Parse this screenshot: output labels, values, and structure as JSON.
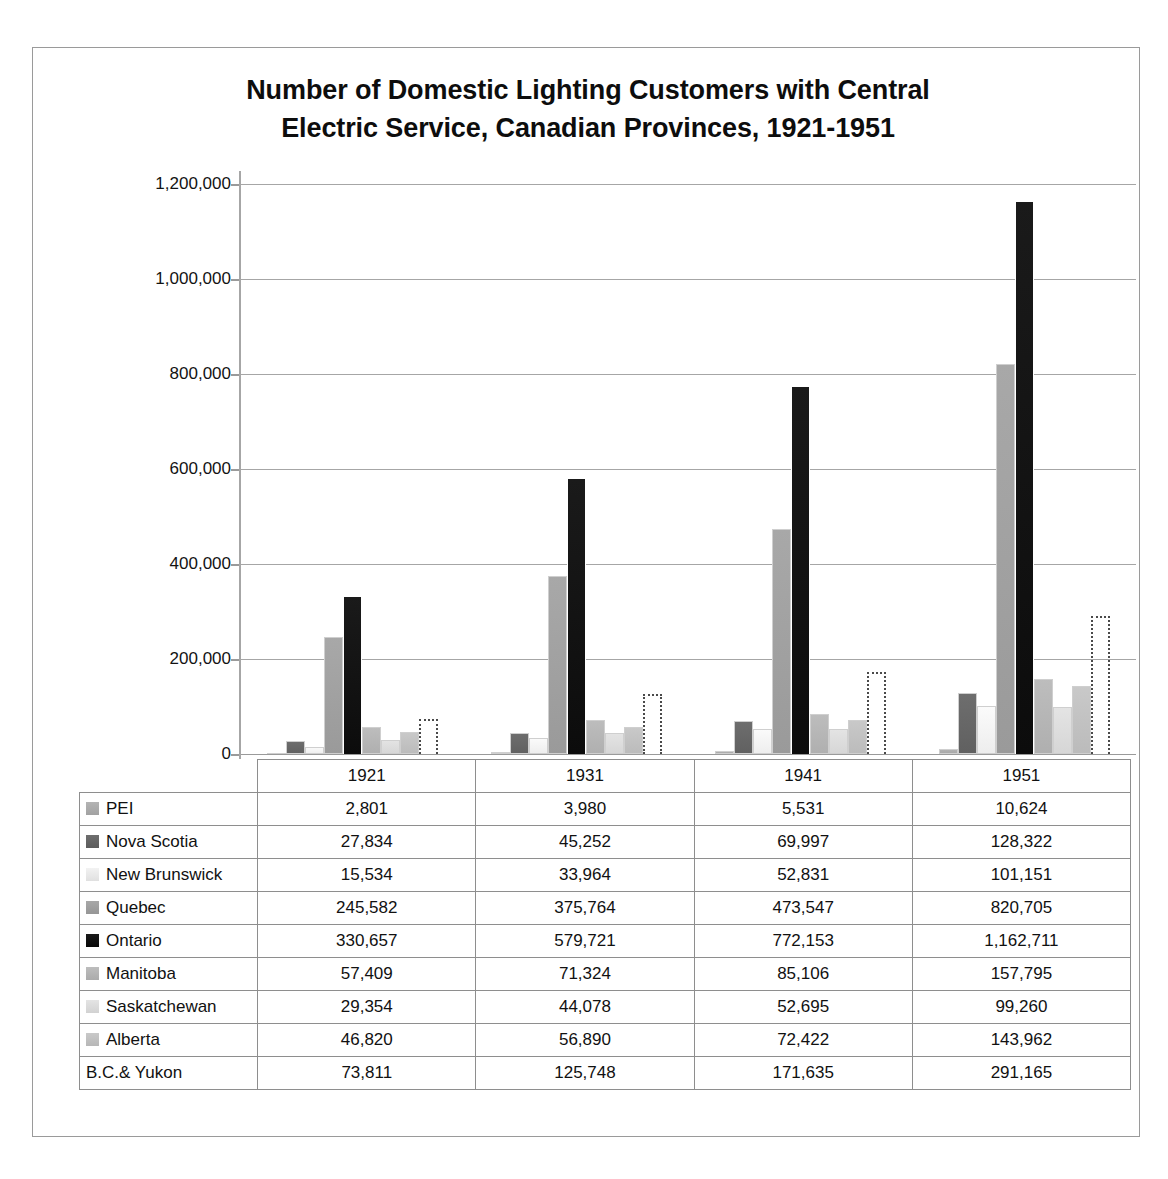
{
  "chart_data": {
    "type": "bar",
    "title": "Number of Domestic Lighting Customers with Central Electric Service, Canadian Provinces, 1921-1951",
    "title_line1": "Number of Domestic Lighting Customers with Central",
    "title_line2": "Electric Service, Canadian Provinces, 1921-1951",
    "xlabel": "",
    "ylabel": "",
    "ylim": [
      0,
      1200000
    ],
    "grid": true,
    "legend_position": "table-row-labels",
    "categories": [
      "1921",
      "1931",
      "1941",
      "1951"
    ],
    "ytick_labels": [
      "1,200,000",
      "1,000,000",
      "800,000",
      "600,000",
      "400,000",
      "200,000",
      "0"
    ],
    "ytick_values": [
      1200000,
      1000000,
      800000,
      600000,
      400000,
      200000,
      0
    ],
    "series": [
      {
        "name": "PEI",
        "color": "#b4b4b4",
        "values": [
          2801,
          3980,
          5531,
          10624
        ],
        "display": [
          "2,801",
          "3,980",
          "5,531",
          "10,624"
        ]
      },
      {
        "name": "Nova Scotia",
        "color": "#6e6e6e",
        "values": [
          27834,
          45252,
          69997,
          128322
        ],
        "display": [
          "27,834",
          "45,252",
          "69,997",
          "128,322"
        ]
      },
      {
        "name": "New Brunswick",
        "color": "#fbfbfb",
        "values": [
          15534,
          33964,
          52831,
          101151
        ],
        "display": [
          "15,534",
          "33,964",
          "52,831",
          "101,151"
        ]
      },
      {
        "name": "Quebec",
        "color": "#a8a8a8",
        "values": [
          245582,
          375764,
          473547,
          820705
        ],
        "display": [
          "245,582",
          "375,764",
          "473,547",
          "820,705"
        ]
      },
      {
        "name": "Ontario",
        "color": "#1a1a1a",
        "values": [
          330657,
          579721,
          772153,
          1162711
        ],
        "display": [
          "330,657",
          "579,721",
          "772,153",
          "1,162,711"
        ]
      },
      {
        "name": "Manitoba",
        "color": "#bdbdbd",
        "values": [
          57409,
          71324,
          85106,
          157795
        ],
        "display": [
          "57,409",
          "71,324",
          "85,106",
          "157,795"
        ]
      },
      {
        "name": "Saskatchewan",
        "color": "#e4e4e4",
        "values": [
          29354,
          44078,
          52695,
          99260
        ],
        "display": [
          "29,354",
          "44,078",
          "52,695",
          "99,260"
        ]
      },
      {
        "name": "Alberta",
        "color": "#c9c9c9",
        "values": [
          46820,
          56890,
          72422,
          143962
        ],
        "display": [
          "46,820",
          "56,890",
          "72,422",
          "143,962"
        ]
      },
      {
        "name": "B.C.& Yukon",
        "color": "#ffffff",
        "values": [
          73811,
          125748,
          171635,
          291165
        ],
        "display": [
          "73,811",
          "125,748",
          "171,635",
          "291,165"
        ]
      }
    ]
  },
  "table": {
    "corner_label": "",
    "column_headers": [
      "1921",
      "1931",
      "1941",
      "1951"
    ],
    "rows": [
      {
        "label": "PEI",
        "swatch": "#b4b4b4",
        "values": [
          "2,801",
          "3,980",
          "5,531",
          "10,624"
        ]
      },
      {
        "label": "Nova Scotia",
        "swatch": "#6e6e6e",
        "values": [
          "27,834",
          "45,252",
          "69,997",
          "128,322"
        ]
      },
      {
        "label": "New Brunswick",
        "swatch": "#f2f2f2",
        "values": [
          "15,534",
          "33,964",
          "52,831",
          "101,151"
        ]
      },
      {
        "label": "Quebec",
        "swatch": "#a8a8a8",
        "values": [
          "245,582",
          "375,764",
          "473,547",
          "820,705"
        ]
      },
      {
        "label": "Ontario",
        "swatch": "#1a1a1a",
        "values": [
          "330,657",
          "579,721",
          "772,153",
          "1,162,711"
        ]
      },
      {
        "label": "Manitoba",
        "swatch": "#bdbdbd",
        "values": [
          "57,409",
          "71,324",
          "85,106",
          "157,795"
        ]
      },
      {
        "label": "Saskatchewan",
        "swatch": "#e4e4e4",
        "values": [
          "29,354",
          "44,078",
          "52,695",
          "99,260"
        ]
      },
      {
        "label": "Alberta",
        "swatch": "#c9c9c9",
        "values": [
          "46,820",
          "56,890",
          "72,422",
          "143,962"
        ]
      },
      {
        "label": "B.C.& Yukon",
        "swatch": "none",
        "values": [
          "73,811",
          "125,748",
          "171,635",
          "291,165"
        ]
      }
    ]
  }
}
